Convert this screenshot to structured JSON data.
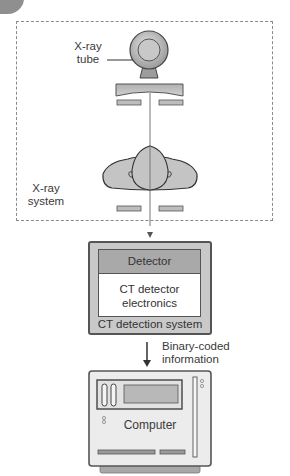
{
  "figure": {
    "top_text": "...p...   ..   ..  ..  ..  ..."
  },
  "xray_system": {
    "label_line1": "X-ray",
    "label_line2": "system",
    "tube_label_line1": "X-ray",
    "tube_label_line2": "tube"
  },
  "ct_detection": {
    "detector_label": "Detector",
    "electronics_line1": "CT detector",
    "electronics_line2": "electronics",
    "system_label": "CT detection system"
  },
  "link": {
    "label_line1": "Binary-coded",
    "label_line2": "information"
  },
  "computer": {
    "label": "Computer"
  },
  "colors": {
    "outline": "#555555",
    "fill_gray": "#c4c4c4",
    "fill_dark_gray": "#a9a9a9",
    "dash": "#8a8a8a",
    "beam": "#777777"
  }
}
